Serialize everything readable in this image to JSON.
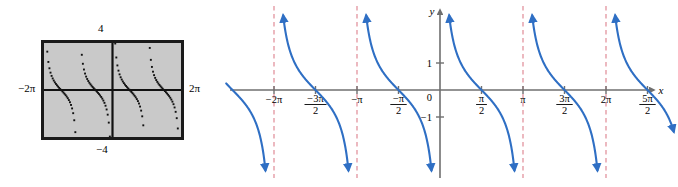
{
  "figure": {
    "panels": [
      "calculator-screen",
      "coordinate-graph"
    ]
  },
  "calculator": {
    "label_top": "4",
    "label_bottom": "−4",
    "label_left": "−2π",
    "label_right": "2π",
    "screen_fill": "#c9c9c9",
    "frame_color": "#1a1a1a",
    "dot_color": "#111111",
    "window": {
      "xmin": -6.283185307,
      "xmax": 6.283185307,
      "ymin": -4,
      "ymax": 4
    }
  },
  "graph": {
    "x_axis_label": "x",
    "y_axis_label": "y",
    "axis_color": "#777777",
    "curve_color": "#2f6fc4",
    "asymptote_color": "#e08a96",
    "y_ticks": [
      {
        "value": 1,
        "label": "1"
      },
      {
        "value": 0,
        "label": "0"
      },
      {
        "value": -1,
        "label": "−1"
      }
    ],
    "x_ticks": [
      {
        "value": -6.283185307,
        "label": "−2π",
        "type": "plain"
      },
      {
        "value": -4.71238898,
        "label": "−3π",
        "sub": "2",
        "type": "fraction"
      },
      {
        "value": -3.141592653,
        "label": "−π",
        "type": "plain"
      },
      {
        "value": -1.570796327,
        "label": "−π",
        "sub": "2",
        "type": "fraction"
      },
      {
        "value": 1.570796327,
        "label": "π",
        "sub": "2",
        "type": "fraction"
      },
      {
        "value": 3.141592653,
        "label": "π",
        "type": "plain"
      },
      {
        "value": 4.71238898,
        "label": "3π",
        "sub": "2",
        "type": "fraction"
      },
      {
        "value": 6.283185307,
        "label": "2π",
        "type": "plain"
      },
      {
        "value": 7.853981634,
        "label": "5π",
        "sub": "2",
        "type": "fraction"
      }
    ],
    "asymptotes": [
      {
        "value": -6.283185307,
        "label": "−2π"
      },
      {
        "value": -3.141592653,
        "label": "−π"
      },
      {
        "value": 3.141592653,
        "label": "π"
      },
      {
        "value": 6.283185307,
        "label": "2π"
      }
    ]
  },
  "chart_data": {
    "type": "line",
    "xlabel": "x",
    "ylabel": "y",
    "function": "cotangent",
    "xlim": [
      -7.33,
      8.38
    ],
    "ylim": [
      -3.4,
      3.4
    ],
    "grid": false,
    "legend": "none",
    "period": 3.141592653,
    "asymptotes_at": [
      -6.283185307,
      -3.141592653,
      0,
      3.141592653,
      6.283185307
    ],
    "x_zeros": [
      -4.71238898,
      -1.570796327,
      1.570796327,
      4.71238898,
      7.853981634
    ],
    "branches": [
      {
        "name": "branch -2pi to -pi",
        "domain": [
          -6.283185307,
          -3.141592653
        ]
      },
      {
        "name": "branch -pi to 0",
        "domain": [
          -3.141592653,
          0
        ]
      },
      {
        "name": "branch 0 to pi",
        "domain": [
          0,
          3.141592653
        ]
      },
      {
        "name": "branch pi to 2pi",
        "domain": [
          3.141592653,
          6.283185307
        ]
      },
      {
        "name": "branch 2pi to 3pi",
        "domain": [
          6.283185307,
          9.424777961
        ]
      }
    ],
    "series": [
      {
        "name": "y = cot x",
        "points_description": "decreasing branch repeated every pi, zero at odd multiples of pi/2, vertical asymptotes at integer multiples of pi"
      }
    ]
  }
}
